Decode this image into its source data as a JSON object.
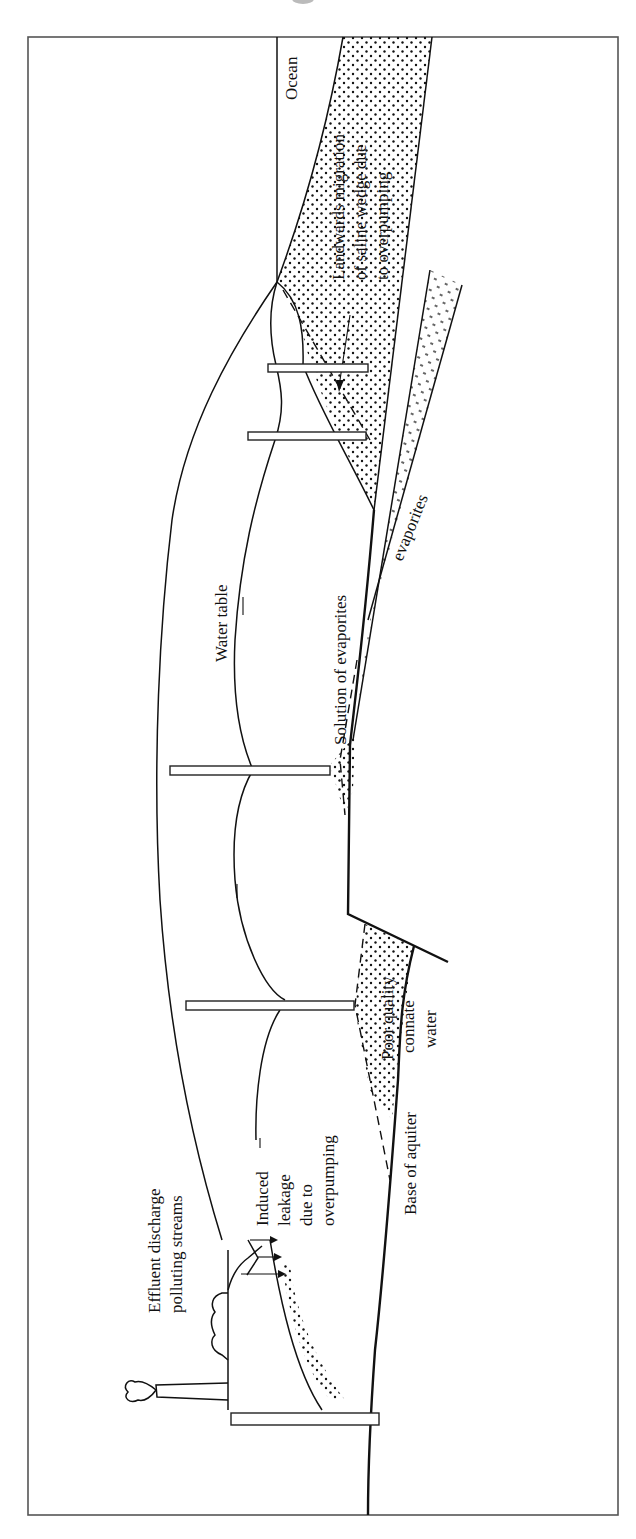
{
  "figure": {
    "orientation": "rotated 90 degrees counter-clockwise"
  },
  "labels": {
    "ocean": "Ocean",
    "saline_line1": "Landwards migration",
    "saline_line2": "of saline wedge due",
    "saline_line3": "to overpumping",
    "water_table": "Water table",
    "solution_evaporites": "Solution of evaporites",
    "evaporites": "evaporites",
    "poor_quality_line1": "Poor quality",
    "poor_quality_line2": "connate",
    "poor_quality_line3": "water",
    "base_aquifer": "Base of aquiter",
    "induced_line1": "Induced",
    "induced_line2": "leakage",
    "induced_line3": "due to",
    "induced_line4": "overpumping",
    "effluent_line1": "Effluent discharge",
    "effluent_line2": "polluting streams"
  },
  "colors": {
    "ink": "#111111",
    "frame": "#555555",
    "background": "#ffffff"
  },
  "wells_count": 6
}
